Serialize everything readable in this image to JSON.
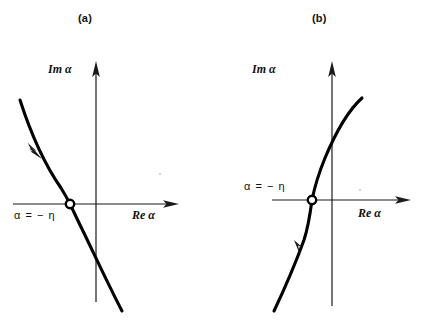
{
  "figure": {
    "type": "two-panel-diagram",
    "background_color": "#ffffff",
    "ink_color": "#000000"
  },
  "panels": [
    {
      "id": "a",
      "caption": "(a)",
      "imaginary_axis_label": "Im α",
      "real_axis_label": "Re α",
      "point_label": "α = − η",
      "curve_direction": "descending",
      "arrow_direction": "down-right",
      "marker_style": "open-circle",
      "marker_position": {
        "x": 70,
        "y": 204
      },
      "origin": {
        "x": 96,
        "y": 204
      }
    },
    {
      "id": "b",
      "caption": "(b)",
      "imaginary_axis_label": "Im α",
      "real_axis_label": "Re α",
      "point_label": "α = − η",
      "curve_direction": "ascending",
      "arrow_direction": "up-right",
      "marker_style": "open-circle",
      "marker_position": {
        "x": 100,
        "y": 200
      },
      "origin": {
        "x": 120,
        "y": 200
      }
    }
  ]
}
